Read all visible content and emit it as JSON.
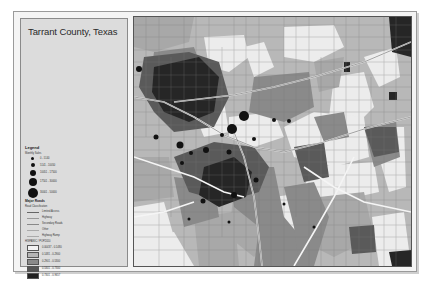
{
  "map": {
    "title": "Tarrant County, Texas",
    "legend": {
      "heading": "Legend",
      "sales_title": "Monthly Sales",
      "sales_classes": [
        {
          "label": "0 - 5140",
          "size": 3
        },
        {
          "label": "5141 - 10050",
          "size": 4
        },
        {
          "label": "10051 - 17500",
          "size": 6
        },
        {
          "label": "17501 - 30000",
          "size": 8
        },
        {
          "label": "30001 - 50000",
          "size": 10
        }
      ],
      "roads_title": "Major Roads",
      "roads_subtitle": "Road Classification",
      "road_classes": [
        {
          "label": "Limited Access",
          "color": "#777777",
          "width": 1
        },
        {
          "label": "Highway",
          "color": "#999999",
          "width": 1
        },
        {
          "label": "Secondary Roads",
          "color": "#888888",
          "width": 0.7
        },
        {
          "label": "Other",
          "color": "#aaaaaa",
          "width": 0.5
        },
        {
          "label": "Highway Ramp",
          "color": "#aaaaaa",
          "width": 0.5
        }
      ],
      "pop_title": "HISPANIC / POP2010",
      "pop_classes": [
        {
          "label": "0.00437 - 0.1480",
          "color": "#f2f2f2"
        },
        {
          "label": "0.1481 - 0.2900",
          "color": "#b4b4b4"
        },
        {
          "label": "0.2901 - 0.5300",
          "color": "#8a8a8a"
        },
        {
          "label": "0.5301 - 0.7300",
          "color": "#555555"
        },
        {
          "label": "0.7301 - 0.9657",
          "color": "#222222"
        }
      ]
    },
    "colors": {
      "class1": "#f0f0f0",
      "class2": "#bdbdbd",
      "class3": "#8e8e8e",
      "class4": "#5a5a5a",
      "class5": "#262626",
      "road": "#ffffff",
      "frame_bg": "#f4f4f4",
      "legend_bg": "#dcdcdc"
    }
  }
}
